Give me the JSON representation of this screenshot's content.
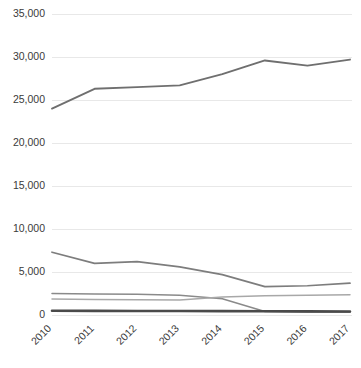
{
  "chart_data": {
    "type": "line",
    "title": "",
    "subtitle": "",
    "xlabel": "",
    "ylabel": "",
    "categories": [
      "2010",
      "2011",
      "2012",
      "2013",
      "2014",
      "2015",
      "2016",
      "2017"
    ],
    "ylim": [
      0,
      35000
    ],
    "ytick_labels": [
      "0",
      "5,000",
      "10,000",
      "15,000",
      "20,000",
      "25,000",
      "30,000",
      "35,000"
    ],
    "ytick_values": [
      0,
      5000,
      10000,
      15000,
      20000,
      25000,
      30000,
      35000
    ],
    "grid": true,
    "grid_axis": "y",
    "grid_color": "#e8e8e8",
    "legend": false,
    "legend_position": "none",
    "background_color": "#ffffff",
    "xtick_rotation": 45,
    "series": [
      {
        "name": "Series 1",
        "color": "#6f6f6f",
        "width": 1.9,
        "values": [
          24000,
          26300,
          26500,
          26700,
          28000,
          29600,
          29000,
          29700
        ]
      },
      {
        "name": "Series 2",
        "color": "#7d7d7d",
        "width": 1.7,
        "values": [
          7300,
          6000,
          6200,
          5600,
          4700,
          3300,
          3400,
          3700
        ]
      },
      {
        "name": "Series 3",
        "color": "#8a8a8a",
        "width": 1.5,
        "values": [
          2500,
          2450,
          2400,
          2300,
          1900,
          400,
          350,
          320
        ]
      },
      {
        "name": "Series 4",
        "color": "#a8a8a8",
        "width": 1.5,
        "values": [
          1850,
          1800,
          1780,
          1750,
          2100,
          2250,
          2300,
          2350
        ]
      },
      {
        "name": "Series 5",
        "color": "#4a4a4a",
        "width": 2.6,
        "values": [
          500,
          480,
          470,
          460,
          450,
          430,
          420,
          410
        ]
      }
    ]
  },
  "plot": {
    "left": 52,
    "right": 350,
    "top": 14,
    "bottom": 315
  }
}
